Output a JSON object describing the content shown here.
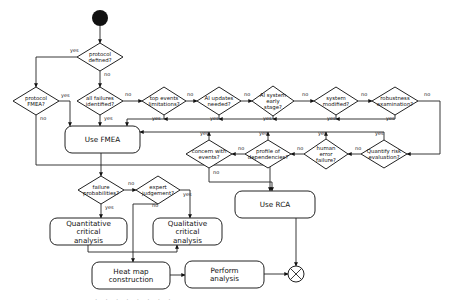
{
  "diagram": {
    "type": "flowchart",
    "start": {
      "id": "start",
      "cx": 100,
      "cy": 18,
      "r": 8,
      "color": "#111111"
    },
    "decisions": [
      {
        "id": "protocol-defined",
        "lines": [
          "protocol",
          "defined?"
        ],
        "cx": 100,
        "cy": 57,
        "w": 46,
        "h": 28
      },
      {
        "id": "protocol-fmea",
        "lines": [
          "protocol",
          "FMEA?"
        ],
        "cx": 36,
        "cy": 101,
        "w": 46,
        "h": 28
      },
      {
        "id": "all-failures",
        "lines": [
          "all failures",
          "identified?"
        ],
        "cx": 100,
        "cy": 101,
        "w": 46,
        "h": 28
      },
      {
        "id": "top-events",
        "lines": [
          "top events",
          "limitations?"
        ],
        "cx": 164,
        "cy": 101,
        "w": 44,
        "h": 28
      },
      {
        "id": "ai-updates",
        "lines": [
          "AI updates",
          "needed?"
        ],
        "cx": 219,
        "cy": 101,
        "w": 44,
        "h": 28
      },
      {
        "id": "ai-system-early",
        "lines": [
          "AI system",
          "early",
          "stage?"
        ],
        "cx": 273,
        "cy": 101,
        "w": 42,
        "h": 30
      },
      {
        "id": "system-modified",
        "lines": [
          "system",
          "modified?"
        ],
        "cx": 336,
        "cy": 101,
        "w": 44,
        "h": 28
      },
      {
        "id": "robustness-exam",
        "lines": [
          "robustness",
          "examination?"
        ],
        "cx": 395,
        "cy": 101,
        "w": 46,
        "h": 28
      },
      {
        "id": "quantify-risk",
        "lines": [
          "Quantify risk",
          "evaluation?"
        ],
        "cx": 384,
        "cy": 154,
        "w": 46,
        "h": 28
      },
      {
        "id": "human-error",
        "lines": [
          "human",
          "error",
          "failure?"
        ],
        "cx": 326,
        "cy": 154,
        "w": 44,
        "h": 30
      },
      {
        "id": "profile-dependencies",
        "lines": [
          "profile of",
          "dependencies?"
        ],
        "cx": 268,
        "cy": 154,
        "w": 46,
        "h": 28
      },
      {
        "id": "concern-events",
        "lines": [
          "concern with",
          "events?"
        ],
        "cx": 209,
        "cy": 154,
        "w": 46,
        "h": 28
      },
      {
        "id": "failure-probabilities",
        "lines": [
          "failure",
          "probabilities?"
        ],
        "cx": 101,
        "cy": 190,
        "w": 46,
        "h": 28
      },
      {
        "id": "expert-judgement",
        "lines": [
          "expert",
          "judgement?"
        ],
        "cx": 158,
        "cy": 190,
        "w": 44,
        "h": 28
      }
    ],
    "boxes": [
      {
        "id": "use-fmea",
        "lines": [
          "Use FMEA"
        ],
        "x": 65,
        "y": 126,
        "w": 75,
        "h": 27
      },
      {
        "id": "use-rca",
        "lines": [
          "Use RCA"
        ],
        "x": 235,
        "y": 191,
        "w": 80,
        "h": 27
      },
      {
        "id": "quantitative-analysis",
        "lines": [
          "Quantitative",
          "critical",
          "analysis"
        ],
        "x": 50,
        "y": 218,
        "w": 77,
        "h": 27
      },
      {
        "id": "qualitative-analysis",
        "lines": [
          "Qualitative",
          "critical",
          "analysis"
        ],
        "x": 153,
        "y": 218,
        "w": 69,
        "h": 27
      },
      {
        "id": "heat-map",
        "lines": [
          "Heat map",
          "construction"
        ],
        "x": 92,
        "y": 262,
        "w": 78,
        "h": 27
      },
      {
        "id": "perform-analysis",
        "lines": [
          "Perform",
          "analysis"
        ],
        "x": 185,
        "y": 261,
        "w": 79,
        "h": 27
      }
    ],
    "end": {
      "id": "end",
      "cx": 296,
      "cy": 274,
      "r": 8
    },
    "edges": [
      {
        "from": "start",
        "to": "protocol-defined",
        "label": "",
        "points": [
          [
            100,
            26
          ],
          [
            100,
            43
          ]
        ]
      },
      {
        "from": "protocol-defined",
        "to": "protocol-fmea",
        "label": "yes",
        "lx": 70,
        "ly": 52,
        "points": [
          [
            77,
            57
          ],
          [
            36,
            57
          ],
          [
            36,
            87
          ]
        ]
      },
      {
        "from": "protocol-defined",
        "to": "all-failures",
        "label": "no",
        "lx": 104,
        "ly": 76,
        "points": [
          [
            100,
            71
          ],
          [
            100,
            87
          ]
        ]
      },
      {
        "from": "protocol-fmea",
        "to": "use-fmea",
        "label": "yes",
        "lx": 61,
        "ly": 97,
        "points": [
          [
            59,
            101
          ],
          [
            70,
            101
          ],
          [
            70,
            126
          ]
        ]
      },
      {
        "from": "protocol-fmea",
        "to": "use-rca",
        "label": "no",
        "lx": 40,
        "ly": 120,
        "points": [
          [
            36,
            115
          ],
          [
            36,
            165
          ],
          [
            270,
            165
          ],
          [
            270,
            191
          ]
        ]
      },
      {
        "from": "all-failures",
        "to": "top-events",
        "label": "no",
        "lx": 125,
        "ly": 96,
        "points": [
          [
            123,
            101
          ],
          [
            142,
            101
          ]
        ]
      },
      {
        "from": "all-failures",
        "to": "use-fmea",
        "label": "yes",
        "lx": 104,
        "ly": 120,
        "points": [
          [
            100,
            115
          ],
          [
            100,
            126
          ]
        ]
      },
      {
        "from": "top-events",
        "to": "ai-updates",
        "label": "no",
        "lx": 187,
        "ly": 96,
        "points": [
          [
            186,
            101
          ],
          [
            197,
            101
          ]
        ]
      },
      {
        "from": "top-events",
        "to": "use-fmea",
        "label": "yes",
        "lx": 152,
        "ly": 120,
        "points": [
          [
            164,
            115
          ],
          [
            164,
            119
          ],
          [
            127,
            119
          ],
          [
            127,
            126
          ]
        ]
      },
      {
        "from": "ai-updates",
        "to": "ai-system-early",
        "label": "no",
        "lx": 244,
        "ly": 96,
        "points": [
          [
            241,
            101
          ],
          [
            252,
            101
          ]
        ]
      },
      {
        "from": "ai-updates",
        "to": "use-fmea",
        "label": "yes",
        "lx": 210,
        "ly": 120,
        "points": [
          [
            219,
            115
          ],
          [
            219,
            119
          ],
          [
            164,
            119
          ]
        ]
      },
      {
        "from": "ai-system-early",
        "to": "system-modified",
        "label": "no",
        "lx": 302,
        "ly": 96,
        "points": [
          [
            294,
            101
          ],
          [
            314,
            101
          ]
        ]
      },
      {
        "from": "ai-system-early",
        "to": "use-fmea",
        "label": "yes",
        "lx": 263,
        "ly": 120,
        "points": [
          [
            273,
            116
          ],
          [
            273,
            119
          ],
          [
            219,
            119
          ]
        ]
      },
      {
        "from": "system-modified",
        "to": "robustness-exam",
        "label": "no",
        "lx": 361,
        "ly": 96,
        "points": [
          [
            358,
            101
          ],
          [
            372,
            101
          ]
        ]
      },
      {
        "from": "system-modified",
        "to": "use-fmea",
        "label": "yes",
        "lx": 327,
        "ly": 120,
        "points": [
          [
            336,
            115
          ],
          [
            336,
            119
          ],
          [
            273,
            119
          ]
        ]
      },
      {
        "from": "robustness-exam",
        "to": "quantify-risk",
        "label": "no",
        "lx": 424,
        "ly": 96,
        "points": [
          [
            418,
            101
          ],
          [
            440,
            101
          ],
          [
            440,
            154
          ],
          [
            407,
            154
          ]
        ]
      },
      {
        "from": "robustness-exam",
        "to": "use-fmea",
        "label": "yes",
        "lx": 386,
        "ly": 120,
        "points": [
          [
            395,
            115
          ],
          [
            395,
            119
          ],
          [
            336,
            119
          ]
        ]
      },
      {
        "from": "quantify-risk",
        "to": "human-error",
        "label": "no",
        "lx": 355,
        "ly": 150,
        "points": [
          [
            361,
            154
          ],
          [
            348,
            154
          ]
        ]
      },
      {
        "from": "quantify-risk",
        "to": "use-fmea",
        "label": "yes",
        "lx": 375,
        "ly": 135,
        "points": [
          [
            384,
            140
          ],
          [
            384,
            132
          ],
          [
            140,
            132
          ]
        ]
      },
      {
        "from": "human-error",
        "to": "profile-dependencies",
        "label": "no",
        "lx": 297,
        "ly": 150,
        "points": [
          [
            304,
            154
          ],
          [
            291,
            154
          ]
        ]
      },
      {
        "from": "human-error",
        "to": "use-fmea",
        "label": "yes",
        "lx": 318,
        "ly": 135,
        "points": [
          [
            326,
            139
          ],
          [
            326,
            132
          ]
        ]
      },
      {
        "from": "profile-dependencies",
        "to": "concern-events",
        "label": "no",
        "lx": 238,
        "ly": 150,
        "points": [
          [
            245,
            154
          ],
          [
            232,
            154
          ]
        ]
      },
      {
        "from": "profile-dependencies",
        "to": "use-fmea",
        "label": "yes",
        "lx": 259,
        "ly": 135,
        "points": [
          [
            268,
            140
          ],
          [
            268,
            132
          ]
        ]
      },
      {
        "from": "concern-events",
        "to": "use-fmea",
        "label": "yes",
        "lx": 200,
        "ly": 135,
        "points": [
          [
            209,
            140
          ],
          [
            209,
            132
          ]
        ]
      },
      {
        "from": "concern-events",
        "to": "use-rca",
        "label": "no",
        "lx": 213,
        "ly": 174,
        "points": [
          [
            209,
            168
          ],
          [
            209,
            182
          ],
          [
            272,
            182
          ],
          [
            272,
            191
          ]
        ]
      },
      {
        "from": "use-fmea",
        "to": "failure-probabilities",
        "label": "",
        "points": [
          [
            101,
            153
          ],
          [
            101,
            176
          ]
        ]
      },
      {
        "from": "failure-probabilities",
        "to": "expert-judgement",
        "label": "no",
        "lx": 128,
        "ly": 185,
        "points": [
          [
            124,
            190
          ],
          [
            136,
            190
          ]
        ]
      },
      {
        "from": "failure-probabilities",
        "to": "quantitative-analysis",
        "label": "yes",
        "lx": 105,
        "ly": 209,
        "points": [
          [
            101,
            204
          ],
          [
            101,
            218
          ]
        ]
      },
      {
        "from": "expert-judgement",
        "to": "qualitative-analysis",
        "label": "yes",
        "lx": 183,
        "ly": 196,
        "points": [
          [
            180,
            190
          ],
          [
            190,
            190
          ],
          [
            190,
            218
          ]
        ]
      },
      {
        "from": "expert-judgement",
        "to": "heat-map",
        "label": "no",
        "lx": 152,
        "ly": 207,
        "points": [
          [
            158,
            204
          ],
          [
            133,
            204
          ],
          [
            133,
            262
          ]
        ]
      },
      {
        "from": "quantitative-analysis",
        "to": "heat-map",
        "label": "",
        "points": [
          [
            88,
            245
          ],
          [
            88,
            252
          ],
          [
            177,
            252
          ],
          [
            177,
            245
          ]
        ]
      },
      {
        "from": "heat-map",
        "to": "perform-analysis",
        "label": "",
        "points": [
          [
            170,
            275
          ],
          [
            185,
            275
          ]
        ]
      },
      {
        "from": "perform-analysis",
        "to": "end",
        "label": "",
        "points": [
          [
            264,
            274
          ],
          [
            288,
            274
          ]
        ]
      },
      {
        "from": "use-rca",
        "to": "end",
        "label": "",
        "points": [
          [
            296,
            218
          ],
          [
            296,
            266
          ]
        ]
      }
    ],
    "caption": "· · · · · · · ·"
  }
}
